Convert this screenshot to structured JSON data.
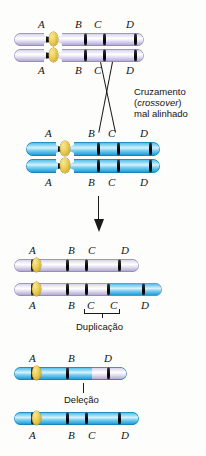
{
  "figure": {
    "colors": {
      "purple_chromatid": "#cfc9e4",
      "blue_chromatid": "#3fb4e8",
      "centromere": "#eccf55",
      "band": "#14141c",
      "text": "#141414",
      "background": "#fdfdfb"
    }
  },
  "panels": {
    "pair_top": {
      "name": "Homologo roxo",
      "top_labels": [
        "A",
        "B",
        "C",
        "D"
      ],
      "bottom_labels": [
        "A",
        "B",
        "C",
        "D"
      ]
    },
    "pair_bottom": {
      "name": "Homologo azul",
      "top_labels": [
        "A",
        "B",
        "C",
        "D"
      ],
      "bottom_labels": [
        "A",
        "B",
        "C",
        "D"
      ]
    },
    "crossover_note": {
      "line1": "Cruzamento",
      "line2_italic": "crossover",
      "line2_open": "(",
      "line2_close": ")",
      "line3": "mal alinhado"
    },
    "duplication": {
      "upper_labels": [
        "A",
        "B",
        "C",
        "D"
      ],
      "lower_labels": [
        "A",
        "B",
        "C",
        "C",
        "D"
      ],
      "bracket_caption": "Duplicação"
    },
    "deletion": {
      "upper_labels": [
        "A",
        "B",
        "D"
      ],
      "leader_caption": "Deleção",
      "lower_labels": [
        "A",
        "B",
        "C",
        "D"
      ]
    }
  }
}
